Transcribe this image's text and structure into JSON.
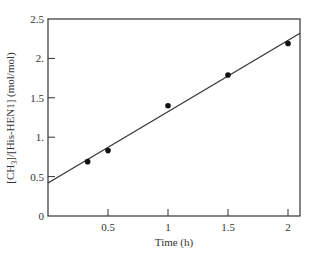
{
  "chart_data": {
    "type": "scatter",
    "title": "",
    "xlabel": "Time (h)",
    "ylabel": "[CH3]/[His-HEN1] (mol/mol)",
    "ylabel_parts": {
      "open": "[CH",
      "sub": "3",
      "rest": "]/[His-HEN1] (mol/mol)"
    },
    "xlim": [
      0,
      2.1
    ],
    "ylim": [
      0,
      2.5
    ],
    "x_ticks": [
      0.5,
      1,
      1.5,
      2
    ],
    "x_tick_labels": [
      "0.5",
      "1",
      "1.5",
      "2"
    ],
    "y_ticks": [
      0,
      0.5,
      1,
      1.5,
      2,
      2.5
    ],
    "y_tick_labels": [
      "0",
      "0.5",
      "1.",
      "1.5",
      "2.",
      "2.5"
    ],
    "grid": false,
    "legend": null,
    "series": [
      {
        "name": "measured",
        "marker": "circle",
        "x": [
          0.33,
          0.5,
          1.0,
          1.5,
          2.0
        ],
        "y": [
          0.69,
          0.83,
          1.4,
          1.79,
          2.19
        ]
      },
      {
        "name": "linear fit",
        "type": "line",
        "x": [
          0,
          2.1
        ],
        "y": [
          0.42,
          2.32
        ]
      }
    ],
    "colors": {
      "axis": "#333333",
      "marker": "#111111",
      "line": "#333333"
    }
  }
}
